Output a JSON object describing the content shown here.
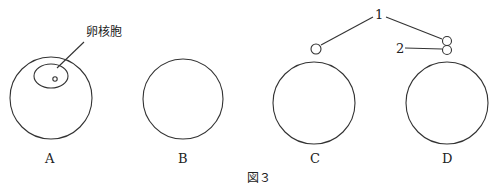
{
  "diagram": {
    "caption": "図３",
    "panels": [
      {
        "id": "A",
        "label": "A",
        "annotation": "卵核胞"
      },
      {
        "id": "B",
        "label": "B"
      },
      {
        "id": "C",
        "label": "C"
      },
      {
        "id": "D",
        "label": "D"
      }
    ],
    "pointers": {
      "one": "1",
      "two": "2"
    },
    "stroke_color": "#333333"
  }
}
